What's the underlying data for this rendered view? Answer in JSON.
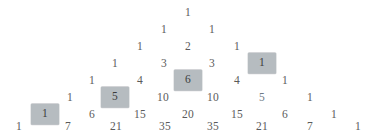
{
  "figure": {
    "name": "pascals-triangle",
    "background_color": "#ffffff",
    "text_color": "#5a5a5a",
    "highlight_background_color": "#b6bcc0",
    "highlight_text_color": "#3c3c3c",
    "tint_text_color": "#6e7a86",
    "row_count": 8,
    "row_spacing_px": 17,
    "column_spacing_px": 48.4,
    "apex_x_px": 188,
    "apex_y_px": 13
  },
  "chart_data": {
    "type": "table",
    "xlabel": "",
    "ylabel": "",
    "grid": false,
    "legend": null,
    "annotations": [
      "Highlighted diagonal cells: 1, 6, 5, 1"
    ],
    "rows": [
      {
        "index": 0,
        "y": 13,
        "values": [
          1
        ]
      },
      {
        "index": 1,
        "y": 30,
        "values": [
          1,
          1
        ]
      },
      {
        "index": 2,
        "y": 47,
        "values": [
          1,
          2,
          1
        ]
      },
      {
        "index": 3,
        "y": 64,
        "values": [
          1,
          3,
          3,
          1
        ]
      },
      {
        "index": 4,
        "y": 81,
        "values": [
          1,
          4,
          6,
          4,
          1
        ]
      },
      {
        "index": 5,
        "y": 98,
        "values": [
          1,
          5,
          10,
          10,
          5,
          1
        ]
      },
      {
        "index": 6,
        "y": 115,
        "values": [
          1,
          6,
          15,
          20,
          15,
          6,
          1
        ]
      },
      {
        "index": 7,
        "y": 127,
        "values": [
          1,
          7,
          21,
          35,
          35,
          21,
          7,
          1
        ]
      }
    ],
    "highlighted": [
      {
        "row": 3,
        "col": 3,
        "value": 1
      },
      {
        "row": 4,
        "col": 2,
        "value": 6
      },
      {
        "row": 5,
        "col": 1,
        "value": 5
      },
      {
        "row": 6,
        "col": 0,
        "value": 1
      }
    ],
    "tinted": [
      {
        "row": 5,
        "col": 4,
        "value": 5
      }
    ]
  },
  "cells": {
    "r0": [
      {
        "text": "1",
        "x": 188,
        "y": 13,
        "hl": false
      }
    ],
    "r1": [
      {
        "text": "1",
        "x": 164,
        "y": 30,
        "hl": false
      },
      {
        "text": "1",
        "x": 212,
        "y": 30,
        "hl": false
      }
    ],
    "r2": [
      {
        "text": "1",
        "x": 140,
        "y": 47,
        "hl": false
      },
      {
        "text": "2",
        "x": 188,
        "y": 47,
        "hl": false
      },
      {
        "text": "1",
        "x": 237,
        "y": 47,
        "hl": false
      }
    ],
    "r3": [
      {
        "text": "1",
        "x": 115,
        "y": 64,
        "hl": false
      },
      {
        "text": "3",
        "x": 164,
        "y": 64,
        "hl": false
      },
      {
        "text": "3",
        "x": 212,
        "y": 64,
        "hl": false
      },
      {
        "text": "1",
        "x": 262,
        "y": 63,
        "hl": true
      }
    ],
    "r4": [
      {
        "text": "1",
        "x": 92,
        "y": 81,
        "hl": false
      },
      {
        "text": "4",
        "x": 140,
        "y": 81,
        "hl": false
      },
      {
        "text": "6",
        "x": 188,
        "y": 80,
        "hl": true
      },
      {
        "text": "4",
        "x": 237,
        "y": 81,
        "hl": false
      },
      {
        "text": "1",
        "x": 285,
        "y": 81,
        "hl": false
      }
    ],
    "r5": [
      {
        "text": "1",
        "x": 70,
        "y": 98,
        "hl": false
      },
      {
        "text": "5",
        "x": 115,
        "y": 97,
        "hl": true
      },
      {
        "text": "10",
        "x": 163,
        "y": 98,
        "hl": false
      },
      {
        "text": "10",
        "x": 213,
        "y": 98,
        "hl": false
      },
      {
        "text": "5",
        "x": 262,
        "y": 98,
        "hl": false,
        "tint": true
      },
      {
        "text": "1",
        "x": 310,
        "y": 98,
        "hl": false
      }
    ],
    "r6": [
      {
        "text": "1",
        "x": 45,
        "y": 114,
        "hl": true
      },
      {
        "text": "6",
        "x": 92,
        "y": 115,
        "hl": false
      },
      {
        "text": "15",
        "x": 140,
        "y": 115,
        "hl": false
      },
      {
        "text": "20",
        "x": 188,
        "y": 115,
        "hl": false
      },
      {
        "text": "15",
        "x": 237,
        "y": 115,
        "hl": false
      },
      {
        "text": "6",
        "x": 285,
        "y": 115,
        "hl": false
      },
      {
        "text": "1",
        "x": 334,
        "y": 115,
        "hl": false
      }
    ],
    "r7": [
      {
        "text": "1",
        "x": 19,
        "y": 127,
        "hl": false
      },
      {
        "text": "7",
        "x": 68,
        "y": 127,
        "hl": false
      },
      {
        "text": "21",
        "x": 116,
        "y": 127,
        "hl": false
      },
      {
        "text": "35",
        "x": 165,
        "y": 127,
        "hl": false
      },
      {
        "text": "35",
        "x": 213,
        "y": 127,
        "hl": false
      },
      {
        "text": "21",
        "x": 262,
        "y": 127,
        "hl": false
      },
      {
        "text": "7",
        "x": 310,
        "y": 127,
        "hl": false
      },
      {
        "text": "1",
        "x": 358,
        "y": 127,
        "hl": false
      }
    ]
  }
}
